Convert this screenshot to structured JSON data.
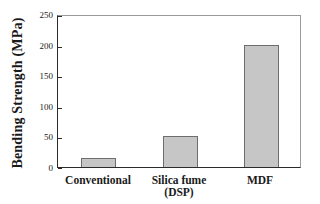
{
  "chart_data": {
    "type": "bar",
    "categories": [
      "Conventional",
      "Silica fume\n(DSP)",
      "MDF"
    ],
    "values": [
      15,
      50,
      200
    ],
    "title": "",
    "xlabel": "",
    "ylabel": "Bending Strength (MPa)",
    "ylim": [
      0,
      250
    ],
    "yticks": [
      0,
      50,
      100,
      150,
      200,
      250
    ],
    "grid": false,
    "legend": "none",
    "colors": {
      "bar_fill": "#c6c6c6",
      "bar_border": "#6e6e6e",
      "axis": "#2b2b2b",
      "box": "#9a9a9a",
      "text": "#1a1a1a",
      "background": "#ffffff"
    }
  }
}
